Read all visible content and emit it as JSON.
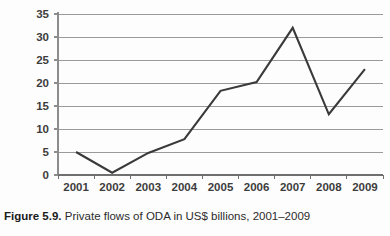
{
  "caption": {
    "label": "Figure 5.9.",
    "text": "Private flows of ODA in US$ billions, 2001–2009"
  },
  "chart_data": {
    "type": "line",
    "title": "",
    "xlabel": "",
    "ylabel": "",
    "categories": [
      "2001",
      "2002",
      "2003",
      "2004",
      "2005",
      "2006",
      "2007",
      "2008",
      "2009"
    ],
    "values": [
      5,
      0.5,
      4.8,
      7.8,
      18.3,
      20.2,
      32,
      13.2,
      23
    ],
    "ylim": [
      0,
      35
    ],
    "ytick_labels": [
      "0",
      "5",
      "10",
      "15",
      "20",
      "25",
      "30",
      "35"
    ],
    "ytick_values": [
      0,
      5,
      10,
      15,
      20,
      25,
      30,
      35
    ],
    "grid": true,
    "legend": false,
    "series_color": "#3a3a3a",
    "grid_color": "#9a9a9a",
    "axis_color": "#8c8c8c",
    "label_color": "#3d3d3d"
  }
}
